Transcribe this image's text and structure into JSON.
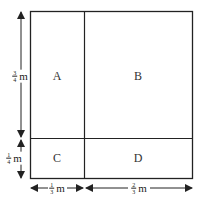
{
  "diagram": {
    "regions": [
      {
        "id": "A",
        "label": "A",
        "x": 57,
        "y": 76
      },
      {
        "id": "B",
        "label": "B",
        "x": 138,
        "y": 76
      },
      {
        "id": "C",
        "label": "C",
        "x": 57,
        "y": 158
      },
      {
        "id": "D",
        "label": "D",
        "x": 138,
        "y": 158
      }
    ],
    "dimensions": {
      "left_top": {
        "num": "3",
        "den": "4",
        "unit": "m"
      },
      "left_bottom": {
        "num": "1",
        "den": "4",
        "unit": "m"
      },
      "bottom_left": {
        "num": "1",
        "den": "3",
        "unit": "m"
      },
      "bottom_right": {
        "num": "2",
        "den": "3",
        "unit": "m"
      }
    },
    "colors": {
      "stroke": "#222222",
      "background": "#ffffff"
    }
  }
}
